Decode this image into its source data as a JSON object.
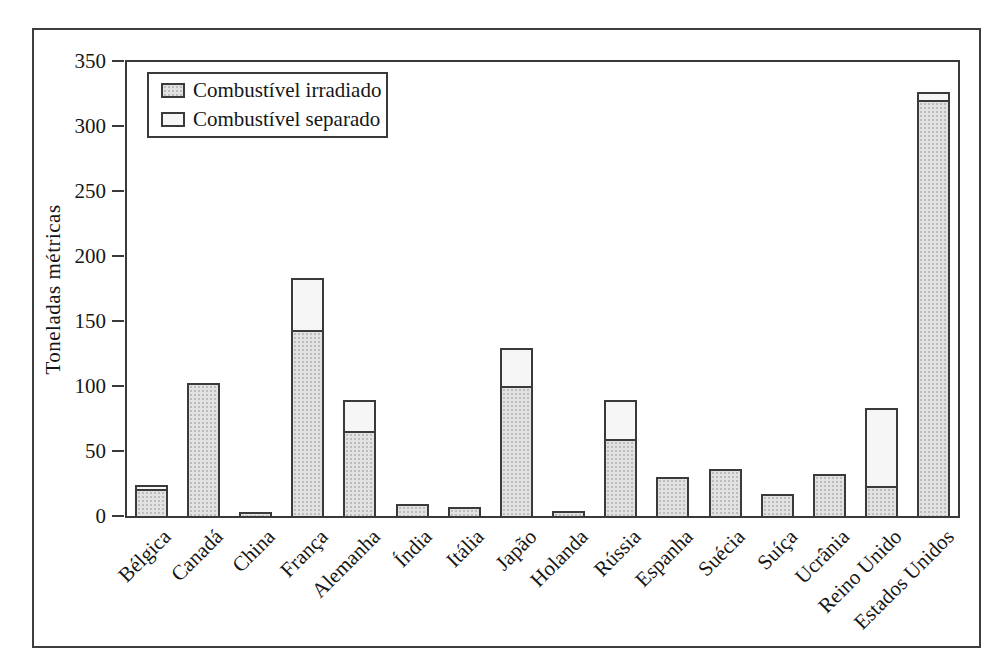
{
  "chart_data": {
    "type": "bar",
    "stacked": true,
    "title": "",
    "xlabel": "",
    "ylabel": "Toneladas métricas",
    "ylim": [
      0,
      350
    ],
    "yticks": [
      "0",
      "50",
      "100",
      "150",
      "200",
      "250",
      "300",
      "350"
    ],
    "grid": false,
    "legend": {
      "position": "top-left-inside",
      "entries": [
        "Combustível irradiado",
        "Combustível separado"
      ]
    },
    "categories": [
      "Bélgica",
      "Canadá",
      "China",
      "França",
      "Alemanha",
      "Índia",
      "Itália",
      "Japão",
      "Holanda",
      "Rússia",
      "Espanha",
      "Suécia",
      "Suíça",
      "Ucrânia",
      "Reino Unido",
      "Estados Unidos"
    ],
    "series": [
      {
        "name": "Combustível irradiado",
        "values": [
          21,
          102,
          3,
          143,
          65,
          9,
          7,
          100,
          4,
          59,
          30,
          36,
          17,
          32,
          23,
          320
        ]
      },
      {
        "name": "Combustível separado",
        "values": [
          3,
          0,
          0,
          40,
          24,
          0,
          0,
          29,
          0,
          30,
          0,
          0,
          0,
          0,
          60,
          6
        ]
      }
    ],
    "totals": [
      24,
      102,
      3,
      183,
      89,
      9,
      7,
      129,
      4,
      89,
      30,
      36,
      17,
      32,
      83,
      326
    ],
    "colors": {
      "irradiado_fill": "#e2e2e2",
      "separado_fill": "#f6f6f6",
      "bar_border": "#3a3a3a",
      "axis": "#3a3a3a",
      "frame": "#3e3e3e",
      "text": "#161616",
      "background": "#ffffff"
    }
  }
}
